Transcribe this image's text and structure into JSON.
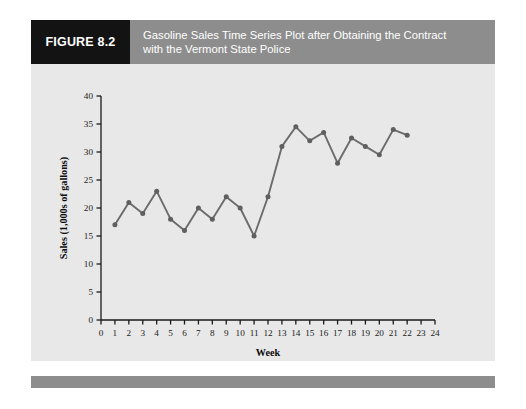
{
  "figure": {
    "number_label": "FIGURE 8.2",
    "title_line1": "Gasoline Sales Time Series Plot after Obtaining the Contract",
    "title_line2": "with the Vermont State Police",
    "title_full": "Gasoline Sales Time Series Plot after Obtaining the Contract with the Vermont State Police"
  },
  "colors": {
    "number_box": "#131313",
    "title_box": "#8d8d8d",
    "footer_bar": "#8d8d8d",
    "plot_background": "#e8e8e8",
    "series_line": "#6b6b6b",
    "marker": "#5f5f5f",
    "axis": "#1a1a1a",
    "page": "#ffffff"
  },
  "chart_data": {
    "type": "line",
    "title": "Gasoline Sales Time Series Plot after Obtaining the Contract with the Vermont State Police",
    "xlabel": "Week",
    "ylabel": "Sales (1,000s of gallons)",
    "xlim": [
      0,
      24
    ],
    "ylim": [
      0,
      40
    ],
    "xticks": [
      0,
      1,
      2,
      3,
      4,
      5,
      6,
      7,
      8,
      9,
      10,
      11,
      12,
      13,
      14,
      15,
      16,
      17,
      18,
      19,
      20,
      21,
      22,
      23,
      24
    ],
    "xtick_labels": [
      "0",
      "1",
      "2",
      "3",
      "4",
      "5",
      "6",
      "7",
      "8",
      "9",
      "10",
      "11",
      "12",
      "13",
      "14",
      "15",
      "16",
      "17",
      "18",
      "19",
      "20",
      "21",
      "22",
      "23",
      "24"
    ],
    "yticks": [
      0,
      5,
      10,
      15,
      20,
      25,
      30,
      35,
      40
    ],
    "ytick_labels": [
      "0",
      "5",
      "10",
      "15",
      "20",
      "25",
      "30",
      "35",
      "40"
    ],
    "grid": false,
    "legend": false,
    "markers": true,
    "x": [
      1,
      2,
      3,
      4,
      5,
      6,
      7,
      8,
      9,
      10,
      11,
      12,
      13,
      14,
      15,
      16,
      17,
      18,
      19,
      20,
      21,
      22
    ],
    "values": [
      17,
      21,
      19,
      23,
      18,
      16,
      20,
      18,
      22,
      20,
      15,
      22,
      31,
      34.5,
      32,
      33.5,
      28,
      32.5,
      31,
      29.5,
      34,
      33
    ],
    "series": [
      {
        "name": "Gasoline Sales",
        "values": [
          17,
          21,
          19,
          23,
          18,
          16,
          20,
          18,
          22,
          20,
          15,
          22,
          31,
          34.5,
          32,
          33.5,
          28,
          32.5,
          31,
          29.5,
          34,
          33
        ]
      }
    ]
  }
}
